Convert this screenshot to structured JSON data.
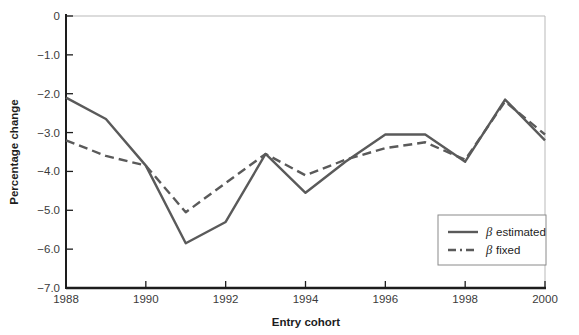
{
  "chart_data": {
    "type": "line",
    "title": "",
    "xlabel": "Entry cohort",
    "ylabel": "Percentage change",
    "x": [
      1988,
      1989,
      1990,
      1991,
      1992,
      1993,
      1994,
      1995,
      1996,
      1997,
      1998,
      1999,
      2000
    ],
    "xlim": [
      1988,
      2000
    ],
    "ylim": [
      -7.0,
      0
    ],
    "xticks": [
      1988,
      1990,
      1992,
      1994,
      1996,
      1998,
      2000
    ],
    "xtick_labels": [
      "1988",
      "1990",
      "1992",
      "1994",
      "1996",
      "1998",
      "2000"
    ],
    "yticks": [
      0,
      -1.0,
      -2.0,
      -3.0,
      -4.0,
      -5.0,
      -6.0,
      -7.0
    ],
    "ytick_labels": [
      "0",
      "−1.0",
      "−2.0",
      "−3.0",
      "−4.0",
      "−5.0",
      "−6.0",
      "−7.0"
    ],
    "grid": false,
    "legend_position": "bottom-right",
    "series": [
      {
        "name": "β estimated",
        "style": "solid",
        "color": "#5a5a5a",
        "values": [
          -2.1,
          -2.65,
          -3.85,
          -5.85,
          -5.3,
          -3.55,
          -4.55,
          -3.75,
          -3.05,
          -3.05,
          -3.75,
          -2.15,
          -3.2
        ]
      },
      {
        "name": "β fixed",
        "style": "dashed",
        "color": "#5a5a5a",
        "values": [
          -3.2,
          -3.6,
          -3.85,
          -5.05,
          -4.3,
          -3.55,
          -4.1,
          -3.7,
          -3.4,
          -3.25,
          -3.7,
          -2.2,
          -3.05
        ]
      }
    ]
  },
  "legend": {
    "items": [
      {
        "beta": "β",
        "label": "estimated",
        "style": "solid"
      },
      {
        "beta": "β",
        "label": "fixed",
        "style": "dashed"
      }
    ]
  },
  "axes": {
    "x_title": "Entry cohort",
    "y_title": "Percentage change"
  },
  "colors": {
    "line": "#5a5a5a",
    "axis": "#1d1d1d",
    "frame": "#b9b9b9",
    "text": "#1d1d1d",
    "tick_text": "#3b3b3b",
    "background": "#ffffff"
  }
}
